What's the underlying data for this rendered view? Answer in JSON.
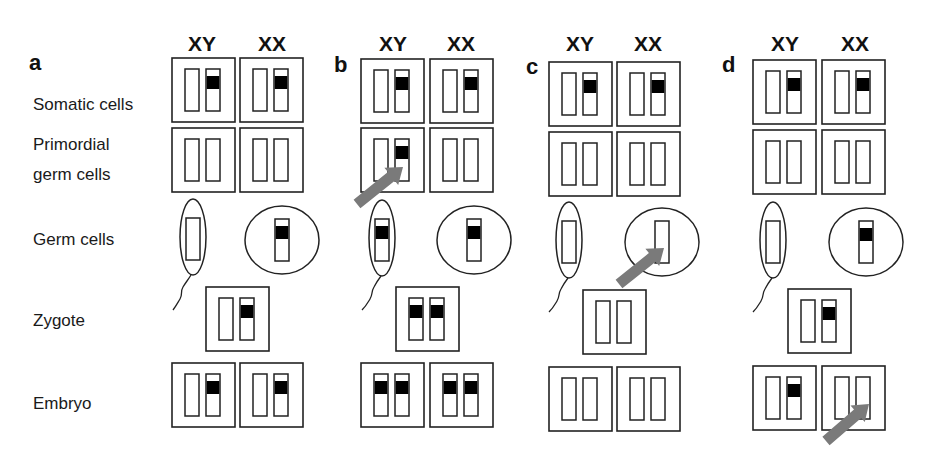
{
  "figure": {
    "row_labels": [
      {
        "id": "somatic",
        "lines": [
          "Somatic cells"
        ]
      },
      {
        "id": "pgc",
        "lines": [
          "Primordial",
          "germ cells"
        ]
      },
      {
        "id": "germ",
        "lines": [
          "Germ cells"
        ]
      },
      {
        "id": "zygote",
        "lines": [
          "Zygote"
        ]
      },
      {
        "id": "embryo",
        "lines": [
          "Embryo"
        ]
      }
    ],
    "column_labels": [
      "XY",
      "XX"
    ],
    "legend_semantics": {
      "open_bar": "chromosome (unmarked allele)",
      "black_band": "marked / active imprint allele",
      "gray_arrow": "site of change in marking"
    },
    "colors": {
      "line": "#222222",
      "band": "#000000",
      "arrow": "#7a7a7a",
      "background": "#ffffff"
    },
    "panels": [
      {
        "letter": "a",
        "somatic": {
          "XY": [
            false,
            true
          ],
          "XX": [
            false,
            true
          ]
        },
        "pgc": {
          "XY": [
            false,
            false
          ],
          "XX": [
            false,
            false
          ]
        },
        "sperm": [
          false
        ],
        "egg": [
          true
        ],
        "zygote": [
          false,
          true
        ],
        "embryo": {
          "XY": [
            false,
            true
          ],
          "XX": [
            false,
            true
          ]
        },
        "arrow": null
      },
      {
        "letter": "b",
        "somatic": {
          "XY": [
            false,
            true
          ],
          "XX": [
            false,
            true
          ]
        },
        "pgc": {
          "XY": [
            false,
            true
          ],
          "XX": [
            false,
            false
          ]
        },
        "sperm": [
          true
        ],
        "egg": [
          true
        ],
        "zygote": [
          true,
          true
        ],
        "embryo": {
          "XY": [
            true,
            true
          ],
          "XX": [
            true,
            true
          ]
        },
        "arrow": "XY primordial germ cell"
      },
      {
        "letter": "c",
        "somatic": {
          "XY": [
            false,
            true
          ],
          "XX": [
            false,
            true
          ]
        },
        "pgc": {
          "XY": [
            false,
            false
          ],
          "XX": [
            false,
            false
          ]
        },
        "sperm": [
          false
        ],
        "egg": [
          false
        ],
        "zygote": [
          false,
          false
        ],
        "embryo": {
          "XY": [
            false,
            false
          ],
          "XX": [
            false,
            false
          ]
        },
        "arrow": "egg"
      },
      {
        "letter": "d",
        "somatic": {
          "XY": [
            false,
            true
          ],
          "XX": [
            false,
            true
          ]
        },
        "pgc": {
          "XY": [
            false,
            false
          ],
          "XX": [
            false,
            false
          ]
        },
        "sperm": [
          false
        ],
        "egg": [
          true
        ],
        "zygote": [
          false,
          true
        ],
        "embryo": {
          "XY": [
            false,
            true
          ],
          "XX": [
            false,
            false
          ]
        },
        "arrow": "XX embryo"
      }
    ]
  }
}
